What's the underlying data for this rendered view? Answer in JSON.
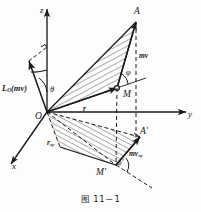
{
  "figure": {
    "caption": "图 11－1",
    "background_color": "#fdfdfd",
    "ink_color": "#1a1a1a"
  },
  "axes": [
    {
      "name": "z-axis",
      "label": "z",
      "description": "vertical axis pointing up"
    },
    {
      "name": "y-axis",
      "label": "y",
      "description": "horizontal axis pointing right"
    },
    {
      "name": "x-axis",
      "label": "x",
      "description": "oblique axis pointing lower-left"
    }
  ],
  "points": [
    {
      "name": "origin",
      "label": "O"
    },
    {
      "name": "particle",
      "label": "M"
    },
    {
      "name": "vector-tip",
      "label": "A"
    },
    {
      "name": "particle-proj",
      "label": "M'"
    },
    {
      "name": "tip-proj",
      "label": "A'"
    }
  ],
  "vectors": [
    {
      "name": "angular-momentum",
      "label": "L",
      "subscript": "O",
      "argument": "(mv)"
    },
    {
      "name": "momentum",
      "label": "mv",
      "subscript": ""
    },
    {
      "name": "position",
      "label": "r",
      "subscript": ""
    },
    {
      "name": "position-xy",
      "label": "r",
      "subscript": "xy"
    },
    {
      "name": "momentum-xy",
      "label": "mv",
      "subscript": "xy"
    }
  ],
  "angles": [
    {
      "name": "theta-angle",
      "label": "θ"
    },
    {
      "name": "phi-angle",
      "label": "φ"
    },
    {
      "name": "phi-prime-angle",
      "label": "φ′"
    }
  ],
  "regions": [
    {
      "name": "moment-triangle",
      "description": "hatched triangle O-M-A"
    },
    {
      "name": "projection-triangle",
      "description": "hatched parallelogram in xy-plane"
    }
  ]
}
